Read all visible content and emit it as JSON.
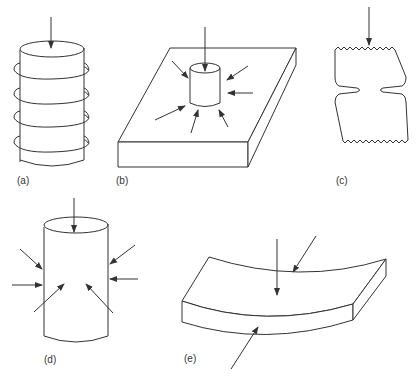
{
  "figure": {
    "colors": {
      "line": "#333333",
      "background": "#ffffff"
    },
    "panels": [
      {
        "id": "a",
        "label": "(a)",
        "shape": "cylinder-with-rings",
        "arrows": 1,
        "rings": 4
      },
      {
        "id": "b",
        "label": "(b)",
        "shape": "cylinder-on-plate",
        "arrows": 8
      },
      {
        "id": "c",
        "label": "(c)",
        "shape": "notched-specimen",
        "arrows": 1
      },
      {
        "id": "d",
        "label": "(d)",
        "shape": "cylinder",
        "arrows": 7
      },
      {
        "id": "e",
        "label": "(e)",
        "shape": "curved-slab",
        "arrows": 3
      }
    ]
  }
}
